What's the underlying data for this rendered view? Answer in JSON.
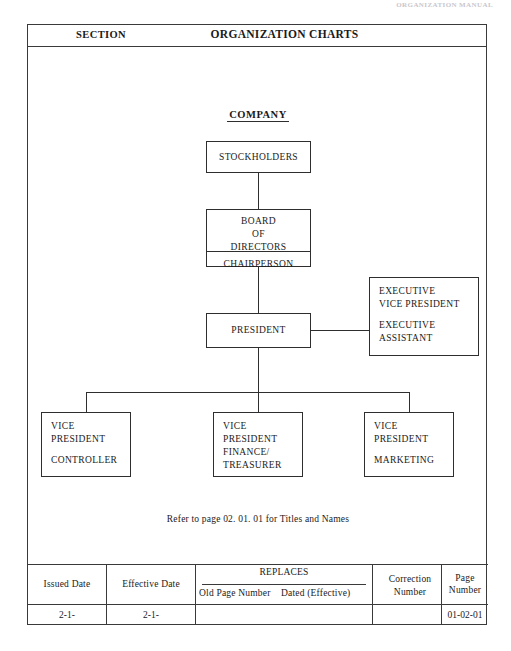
{
  "scan_header": "ORGANIZATION MANUAL",
  "header": {
    "section_label": "SECTION",
    "title": "ORGANIZATION CHARTS"
  },
  "chart": {
    "company_title": "COMPANY",
    "refer_note": "Refer to page 02. 01. 01 for Titles and Names",
    "nodes": {
      "stockholders": {
        "line1": "STOCKHOLDERS"
      },
      "board": {
        "line1": "BOARD",
        "line2": "OF",
        "line3": "DIRECTORS",
        "line4": "CHAIRPERSON"
      },
      "president": {
        "line1": "PRESIDENT"
      },
      "executive_vp": {
        "line1": "EXECUTIVE",
        "line2": "VICE PRESIDENT",
        "line3": "EXECUTIVE",
        "line4": "ASSISTANT"
      },
      "vp_controller": {
        "line1": "VICE",
        "line2": "PRESIDENT",
        "line3": "CONTROLLER"
      },
      "vp_finance": {
        "line1": "VICE",
        "line2": "PRESIDENT",
        "line3": "FINANCE/",
        "line4": "TREASURER"
      },
      "vp_marketing": {
        "line1": "VICE",
        "line2": "PRESIDENT",
        "line3": "MARKETING"
      }
    }
  },
  "footer": {
    "issued_date_header": "Issued Date",
    "effective_date_header": "Effective Date",
    "replaces_header": "REPLACES",
    "old_page_number_header": "Old Page Number",
    "dated_effective_header": "Dated (Effective)",
    "correction_number_header_line1": "Correction",
    "correction_number_header_line2": "Number",
    "page_number_header": "Page Number",
    "issued_date_value": "2-1-",
    "effective_date_value": "2-1-",
    "old_page_number_value": "",
    "dated_effective_value": "",
    "correction_number_value": "",
    "page_number_value": "01-02-01"
  },
  "colors": {
    "ink": "#2e2e2e",
    "frame": "#3a3a3a",
    "paper": "#ffffff"
  }
}
